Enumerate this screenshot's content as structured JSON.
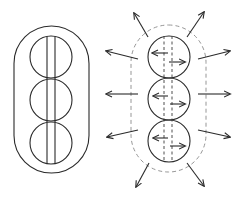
{
  "diagram": {
    "panels": [
      {
        "id": "left",
        "description": "Three stacked circles inside a solid rounded capsule, with two solid vertical lines through the circle centers",
        "capsule": {
          "x": 14,
          "y": 26,
          "w": 75,
          "h": 147,
          "style": "solid"
        },
        "circles": [
          {
            "cx": 51,
            "cy": 57,
            "r": 21
          },
          {
            "cx": 51,
            "cy": 100,
            "r": 21
          },
          {
            "cx": 51,
            "cy": 143,
            "r": 21
          }
        ],
        "vertical_lines": [
          {
            "x": 47,
            "y1": 36,
            "y2": 164,
            "style": "solid"
          },
          {
            "x": 55,
            "y1": 36,
            "y2": 164,
            "style": "solid"
          }
        ]
      },
      {
        "id": "right",
        "description": "Three stacked circles inside a dashed rounded capsule with dashed vertical lines; internal arrows point left and right, external arrows radiate outward",
        "capsule": {
          "x": 131,
          "y": 25,
          "w": 75,
          "h": 147,
          "style": "dashed"
        },
        "circles": [
          {
            "cx": 169,
            "cy": 57,
            "r": 21
          },
          {
            "cx": 169,
            "cy": 99,
            "r": 21
          },
          {
            "cx": 169,
            "cy": 141,
            "r": 21
          }
        ],
        "vertical_lines": [
          {
            "x": 164,
            "y1": 36,
            "y2": 162,
            "style": "dashed"
          },
          {
            "x": 172,
            "y1": 36,
            "y2": 162,
            "style": "dashed"
          }
        ],
        "inner_arrows": [
          {
            "x1": 168,
            "y1": 53,
            "x2": 152,
            "y2": 53
          },
          {
            "x1": 169,
            "y1": 62,
            "x2": 185,
            "y2": 62
          },
          {
            "x1": 168,
            "y1": 96,
            "x2": 153,
            "y2": 96
          },
          {
            "x1": 170,
            "y1": 104,
            "x2": 185,
            "y2": 104
          },
          {
            "x1": 168,
            "y1": 138,
            "x2": 153,
            "y2": 138
          },
          {
            "x1": 170,
            "y1": 146,
            "x2": 185,
            "y2": 146
          }
        ],
        "outer_arrows": [
          {
            "x1": 148,
            "y1": 37,
            "x2": 134,
            "y2": 13
          },
          {
            "x1": 187,
            "y1": 37,
            "x2": 204,
            "y2": 12
          },
          {
            "x1": 138,
            "y1": 59,
            "x2": 106,
            "y2": 51
          },
          {
            "x1": 198,
            "y1": 59,
            "x2": 230,
            "y2": 51
          },
          {
            "x1": 138,
            "y1": 94,
            "x2": 106,
            "y2": 94
          },
          {
            "x1": 198,
            "y1": 94,
            "x2": 230,
            "y2": 94
          },
          {
            "x1": 138,
            "y1": 130,
            "x2": 107,
            "y2": 137
          },
          {
            "x1": 198,
            "y1": 130,
            "x2": 230,
            "y2": 137
          },
          {
            "x1": 149,
            "y1": 163,
            "x2": 136,
            "y2": 187
          },
          {
            "x1": 187,
            "y1": 163,
            "x2": 204,
            "y2": 186
          }
        ]
      }
    ],
    "colors": {
      "stroke": "#2a2a2a",
      "dashed_outline": "#8a8a8a",
      "background": "#ffffff"
    }
  }
}
